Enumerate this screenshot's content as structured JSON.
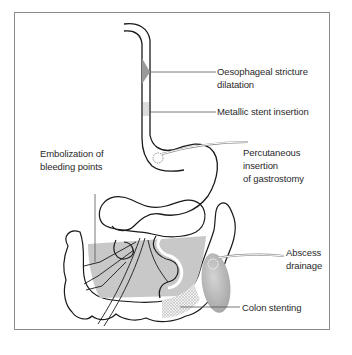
{
  "diagram": {
    "type": "anatomical illustration of gastrointestinal tract with interventional procedures",
    "labels": {
      "oesophageal_stricture_line1": "Oesophageal stricture",
      "oesophageal_stricture_line2": "dilatation",
      "metallic_stent": "Metallic stent insertion",
      "gastrostomy_line1": "Percutaneous",
      "gastrostomy_line2": "insertion",
      "gastrostomy_line3": "of gastrostomy",
      "embolization_line1": "Embolization of",
      "embolization_line2": "bleeding points",
      "abscess_line1": "Abscess",
      "abscess_line2": "drainage",
      "colon_stenting": "Colon stenting"
    },
    "colors": {
      "outline": "#1a1a1a",
      "shading": "#c8c8c8",
      "abscess_fill": "#b8b8b8",
      "leader_line": "#555555",
      "frame": "#8a8a8a",
      "text": "#2a2a2a"
    }
  }
}
